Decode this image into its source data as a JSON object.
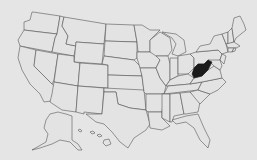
{
  "map": {
    "title": "United States",
    "highlighted_state": "West Virginia",
    "colors": {
      "background": "#e5e5e5",
      "state_fill": "#e3e3e3",
      "state_border": "#4a4a4a",
      "highlight_fill": "#1a1a1a"
    },
    "states": [
      {
        "id": "WA",
        "name": "Washington",
        "d": "M33,12 L60,16 L57,34 L40,32 L24,30 L24,22 L30,20 L32,12 Z"
      },
      {
        "id": "OR",
        "name": "Oregon",
        "d": "M24,30 L40,32 L57,34 L55,38 L52,52 L20,46 L18,40 Z"
      },
      {
        "id": "CA",
        "name": "California",
        "d": "M20,46 L36,50 L34,66 L60,92 L58,100 L44,102 L40,94 L30,84 L22,70 L18,58 Z"
      },
      {
        "id": "ID",
        "name": "Idaho",
        "d": "M60,16 L64,17 L62,26 L68,36 L66,44 L76,46 L74,56 L52,52 L55,38 L57,34 Z"
      },
      {
        "id": "NV",
        "name": "Nevada",
        "d": "M36,50 L58,54 L54,80 L52,84 L34,66 Z"
      },
      {
        "id": "MT",
        "name": "Montana",
        "d": "M64,17 L106,24 L104,44 L76,42 L76,46 L66,44 L68,36 L62,26 Z"
      },
      {
        "id": "WY",
        "name": "Wyoming",
        "d": "M76,42 L104,44 L102,64 L74,62 Z"
      },
      {
        "id": "UT",
        "name": "Utah",
        "d": "M58,54 L74,56 L74,62 L80,63 L78,86 L54,82 Z"
      },
      {
        "id": "AZ",
        "name": "Arizona",
        "d": "M54,82 L78,86 L76,112 L62,110 L50,102 L52,94 Z"
      },
      {
        "id": "CO",
        "name": "Colorado",
        "d": "M80,63 L108,65 L108,88 L78,86 Z"
      },
      {
        "id": "NM",
        "name": "New Mexico",
        "d": "M78,86 L104,88 L102,114 L84,112 L84,114 L76,112 Z"
      },
      {
        "id": "ND",
        "name": "North Dakota",
        "d": "M106,24 L134,25 L137,42 L105,41 Z"
      },
      {
        "id": "SD",
        "name": "South Dakota",
        "d": "M105,41 L137,42 L137,58 L134,60 L104,56 Z"
      },
      {
        "id": "NE",
        "name": "Nebraska",
        "d": "M104,56 L134,60 L140,66 L142,76 L108,75 L108,65 L102,64 Z"
      },
      {
        "id": "KS",
        "name": "Kansas",
        "d": "M108,75 L142,76 L144,92 L108,90 Z"
      },
      {
        "id": "OK",
        "name": "Oklahoma",
        "d": "M104,88 L144,90 L146,110 L130,108 L118,104 L116,92 L104,92 Z"
      },
      {
        "id": "TX",
        "name": "Texas",
        "d": "M104,92 L116,92 L118,104 L130,108 L146,110 L150,124 L146,130 L134,138 L128,148 L120,142 L112,132 L104,124 L96,122 L86,114 L102,114 Z"
      },
      {
        "id": "MN",
        "name": "Minnesota",
        "d": "M134,25 L142,25 L150,30 L160,30 L150,40 L150,52 L138,52 L137,42 Z"
      },
      {
        "id": "IA",
        "name": "Iowa",
        "d": "M137,52 L156,52 L160,60 L156,68 L140,68 L137,58 Z"
      },
      {
        "id": "MO",
        "name": "Missouri",
        "d": "M140,68 L156,68 L160,78 L166,86 L164,94 L146,94 L144,92 L142,76 Z"
      },
      {
        "id": "AR",
        "name": "Arkansas",
        "d": "M146,94 L164,94 L162,112 L148,112 L146,110 Z"
      },
      {
        "id": "LA",
        "name": "Louisiana",
        "d": "M148,112 L162,112 L162,118 L170,126 L162,130 L150,128 Z"
      },
      {
        "id": "WI",
        "name": "Wisconsin",
        "d": "M150,40 L160,32 L170,38 L172,50 L168,56 L156,56 L150,52 Z"
      },
      {
        "id": "IL",
        "name": "Illinois",
        "d": "M156,56 L168,56 L170,64 L170,80 L166,86 L160,78 L156,68 L160,60 Z"
      },
      {
        "id": "MI",
        "name": "Michigan",
        "d": "M162,32 L176,34 L184,40 L186,52 L178,56 L172,54 L176,44 L172,38 Z"
      },
      {
        "id": "IN",
        "name": "Indiana",
        "d": "M170,58 L178,58 L178,76 L170,80 Z"
      },
      {
        "id": "OH",
        "name": "Ohio",
        "d": "M178,56 L190,54 L194,58 L194,68 L188,74 L178,74 Z"
      },
      {
        "id": "KY",
        "name": "Kentucky",
        "d": "M166,86 L170,80 L178,76 L188,74 L194,78 L190,84 L168,86 Z"
      },
      {
        "id": "TN",
        "name": "Tennessee",
        "d": "M164,94 L168,86 L190,84 L202,82 L198,90 L164,94 Z"
      },
      {
        "id": "MS",
        "name": "Mississippi",
        "d": "M162,94 L170,94 L170,122 L162,118 L162,112 Z"
      },
      {
        "id": "AL",
        "name": "Alabama",
        "d": "M170,94 L180,93 L184,114 L174,116 L172,122 L170,122 Z"
      },
      {
        "id": "GA",
        "name": "Georgia",
        "d": "M180,93 L190,92 L200,102 L198,112 L186,114 L184,114 Z"
      },
      {
        "id": "FL",
        "name": "Florida",
        "d": "M172,120 L186,116 L198,114 L204,128 L210,140 L208,148 L200,140 L194,128 L186,122 L176,124 Z"
      },
      {
        "id": "SC",
        "name": "South Carolina",
        "d": "M190,92 L198,90 L210,94 L200,104 Z"
      },
      {
        "id": "NC",
        "name": "North Carolina",
        "d": "M198,90 L202,82 L222,78 L226,82 L218,90 L210,94 Z"
      },
      {
        "id": "VA",
        "name": "Virginia",
        "d": "M190,84 L194,78 L202,76 L208,70 L214,66 L220,70 L222,78 L202,82 Z"
      },
      {
        "id": "WV",
        "name": "West Virginia",
        "d": "M194,68 L198,64 L204,64 L208,60 L212,62 L208,70 L202,76 L194,78 L192,74 Z"
      },
      {
        "id": "PA",
        "name": "Pennsylvania",
        "d": "M190,54 L196,52 L218,50 L222,54 L220,60 L212,62 L208,60 L204,64 L198,64 L194,68 L194,58 Z"
      },
      {
        "id": "MD",
        "name": "Maryland",
        "d": "M208,60 L220,60 L222,66 L220,70 L214,66 Z"
      },
      {
        "id": "NY",
        "name": "New York",
        "d": "M196,52 L200,46 L210,44 L214,36 L222,34 L226,44 L228,52 L222,54 L218,50 Z"
      },
      {
        "id": "NJ",
        "name": "New Jersey",
        "d": "M222,54 L226,56 L224,64 L220,60 Z"
      },
      {
        "id": "VT",
        "name": "Vermont",
        "d": "M222,34 L228,32 L228,44 L226,44 Z"
      },
      {
        "id": "NH",
        "name": "New Hampshire",
        "d": "M228,32 L232,28 L234,42 L228,44 Z"
      },
      {
        "id": "ME",
        "name": "Maine",
        "d": "M232,28 L234,18 L240,16 L244,24 L246,30 L236,38 L234,42 Z"
      },
      {
        "id": "MA",
        "name": "Massachusetts",
        "d": "M226,44 L234,42 L240,46 L236,48 L228,48 Z"
      },
      {
        "id": "CT",
        "name": "Connecticut",
        "d": "M228,48 L234,48 L232,52 L228,52 Z"
      },
      {
        "id": "RI",
        "name": "Rhode Island",
        "d": "M234,48 L236,48 L235,51 L232,52 Z"
      },
      {
        "id": "AK",
        "name": "Alaska",
        "d": "M50,114 L58,112 L66,114 L72,116 L72,140 L78,144 L82,150 L78,150 L70,142 L60,140 L52,144 L40,148 L32,150 L46,142 L48,134 L44,128 L46,120 Z"
      },
      {
        "id": "HI",
        "name": "Hawaii",
        "d": "M78,130 L80,129 L82,131 L80,132 Z M90,132 L93,131 L95,133 L92,134 Z M97,135 L100,134 L102,136 L99,137 Z M104,140 L109,139 L111,144 L106,146 L103,143 Z"
      }
    ]
  }
}
